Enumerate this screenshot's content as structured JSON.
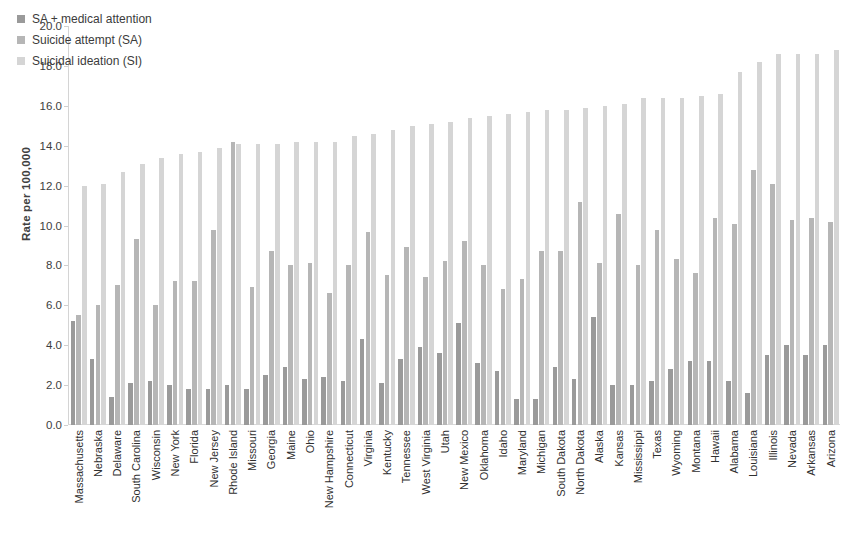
{
  "chart_data": {
    "type": "bar",
    "title": "",
    "xlabel": "",
    "ylabel": "Rate per 100,000",
    "ylim": [
      0.0,
      20.0
    ],
    "ytick_step": 2.0,
    "yticks": [
      "20.0",
      "18.0",
      "16.0",
      "14.0",
      "12.0",
      "10.0",
      "8.0",
      "6.0",
      "4.0",
      "2.0",
      "0.0"
    ],
    "grid": false,
    "legend_position": "top-left",
    "orientation": "vertical",
    "group_mode": "clustered",
    "categories": [
      "Massachusetts",
      "Nebraska",
      "Delaware",
      "South Carolina",
      "Wisconsin",
      "New York",
      "Florida",
      "New Jersey",
      "Rhode Island",
      "Missouri",
      "Georgia",
      "Maine",
      "Ohio",
      "New Hampshire",
      "Connecticut",
      "Virginia",
      "Kentucky",
      "Tennessee",
      "West Virginia",
      "Utah",
      "New Mexico",
      "Oklahoma",
      "Idaho",
      "Maryland",
      "Michigan",
      "South Dakota",
      "North Dakota",
      "Alaska",
      "Kansas",
      "Mississippi",
      "Texas",
      "Wyoming",
      "Montana",
      "Hawaii",
      "Alabama",
      "Louisiana",
      "Illinois",
      "Nevada",
      "Arkansas",
      "Arizona"
    ],
    "series": [
      {
        "name": "SA + medical attention",
        "color": "#9a9a9a",
        "values": [
          5.2,
          3.3,
          1.4,
          2.1,
          2.2,
          2.0,
          1.8,
          1.8,
          2.0,
          1.8,
          2.5,
          2.9,
          2.3,
          2.4,
          2.2,
          4.3,
          2.1,
          3.3,
          3.9,
          3.6,
          5.1,
          3.1,
          2.7,
          1.3,
          1.3,
          2.9,
          2.3,
          5.4,
          2.0,
          2.0,
          2.2,
          2.8,
          3.2,
          3.2,
          2.2,
          1.6,
          3.5,
          4.0,
          3.5,
          4.0
        ]
      },
      {
        "name": "Suicide attempt (SA)",
        "color": "#b6b6b6",
        "values": [
          5.5,
          6.0,
          7.0,
          9.3,
          6.0,
          7.2,
          7.2,
          9.8,
          14.2,
          6.9,
          8.7,
          8.0,
          8.1,
          6.6,
          8.0,
          9.7,
          7.5,
          8.9,
          7.4,
          8.2,
          9.2,
          8.0,
          6.8,
          7.3,
          8.7,
          8.7,
          11.2,
          8.1,
          10.6,
          8.0,
          9.8,
          8.3,
          7.6,
          10.4,
          10.1,
          12.8,
          12.1,
          10.3,
          10.4,
          10.2
        ]
      },
      {
        "name": "Suicidal ideation (SI)",
        "color": "#d5d5d5",
        "values": [
          12.0,
          12.1,
          12.7,
          13.1,
          13.4,
          13.6,
          13.7,
          13.9,
          14.1,
          14.1,
          14.1,
          14.2,
          14.2,
          14.2,
          14.5,
          14.6,
          14.8,
          15.0,
          15.1,
          15.2,
          15.4,
          15.5,
          15.6,
          15.7,
          15.8,
          15.8,
          15.9,
          16.0,
          16.1,
          16.4,
          16.4,
          16.4,
          16.5,
          16.6,
          17.7,
          18.2,
          18.6,
          18.6,
          18.6,
          18.8
        ]
      }
    ],
    "legend": [
      "SA + medical attention",
      "Suicide attempt (SA)",
      "Suicidal ideation (SI)"
    ]
  }
}
